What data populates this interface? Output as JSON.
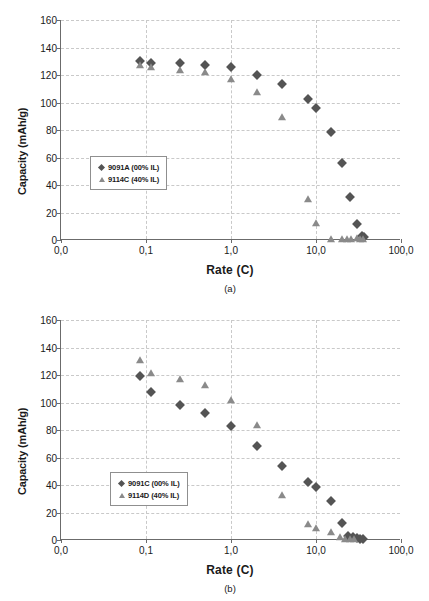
{
  "figure": {
    "panels": [
      {
        "caption": "(a)",
        "legend": [
          {
            "label": "9091A (00% IL)",
            "marker": "diamond-icon"
          },
          {
            "label": "9114C (40% IL)",
            "marker": "triangle-icon"
          }
        ]
      },
      {
        "caption": "(b)",
        "legend": [
          {
            "label": "9091C (00% IL)",
            "marker": "diamond-icon"
          },
          {
            "label": "9114D (40% IL)",
            "marker": "triangle-icon"
          }
        ]
      }
    ],
    "bottom_caption": ""
  },
  "axis": {
    "ylabel": "Capacity (mAh/g)",
    "xlabel": "Rate (C)",
    "yticks": [
      "0",
      "20",
      "40",
      "60",
      "80",
      "100",
      "120",
      "140",
      "160"
    ],
    "ytick_values": [
      0,
      20,
      40,
      60,
      80,
      100,
      120,
      140,
      160
    ],
    "xticks": [
      "0,0",
      "0,1",
      "1,0",
      "10,0",
      "100,0"
    ],
    "xtick_values": [
      0.01,
      0.1,
      1.0,
      10.0,
      100.0
    ]
  },
  "colors": {
    "diamond": "#545454",
    "triangle": "#8a8a8a",
    "axis": "#6b6b6b",
    "grid": "#c9c9c9"
  },
  "chart_data": [
    {
      "type": "scatter",
      "panel": "(a)",
      "title": "",
      "xlabel": "Rate (C)",
      "ylabel": "Capacity (mAh/g)",
      "xscale": "log",
      "xlim": [
        0.01,
        100.0
      ],
      "ylim": [
        0,
        160
      ],
      "grid": true,
      "legend_position": "inside-left",
      "series": [
        {
          "name": "9091A (00% IL)",
          "marker": "diamond",
          "color": "#545454",
          "x": [
            0.085,
            0.115,
            0.25,
            0.5,
            1.0,
            2.0,
            4.0,
            8.0,
            10.0,
            15.0,
            20.0,
            25.0,
            30.0,
            35.0,
            37.0
          ],
          "y": [
            130,
            129,
            128.5,
            127,
            125.5,
            120,
            113.5,
            102.5,
            96,
            78.5,
            56,
            31,
            12,
            3,
            2
          ]
        },
        {
          "name": "9114C (40% IL)",
          "marker": "triangle",
          "color": "#8a8a8a",
          "x": [
            0.085,
            0.115,
            0.25,
            0.5,
            1.0,
            2.0,
            4.0,
            8.0,
            10.0,
            15.0,
            20.0,
            23.0,
            26.0,
            30.0,
            33.0,
            36.0
          ],
          "y": [
            127,
            126,
            123.5,
            122.5,
            117,
            108,
            89.5,
            29.5,
            12.5,
            1,
            0.5,
            0.5,
            0.5,
            1.5,
            1,
            0.5
          ]
        }
      ]
    },
    {
      "type": "scatter",
      "panel": "(b)",
      "title": "",
      "xlabel": "Rate (C)",
      "ylabel": "Capacity (mAh/g)",
      "xscale": "log",
      "xlim": [
        0.01,
        100.0
      ],
      "ylim": [
        0,
        160
      ],
      "grid": true,
      "legend_position": "inside-left",
      "series": [
        {
          "name": "9091C (00% IL)",
          "marker": "diamond",
          "color": "#545454",
          "x": [
            0.085,
            0.115,
            0.25,
            0.5,
            1.0,
            2.0,
            4.0,
            8.0,
            10.0,
            15.0,
            20.0,
            24.0,
            27.0,
            30.0,
            33.0,
            36.0
          ],
          "y": [
            119,
            108,
            98.5,
            92.5,
            83,
            68.5,
            54,
            42,
            38.5,
            28.5,
            12.5,
            3,
            2,
            1.5,
            1,
            0.5
          ]
        },
        {
          "name": "9114D (40% IL)",
          "marker": "triangle",
          "color": "#8a8a8a",
          "x": [
            0.085,
            0.115,
            0.25,
            0.5,
            1.0,
            2.0,
            4.0,
            8.0,
            10.0,
            15.0,
            19.0,
            22.0,
            25.0,
            28.0
          ],
          "y": [
            131,
            121.5,
            117,
            112.5,
            102,
            84,
            32.5,
            11.5,
            9,
            6,
            2.5,
            1,
            0.5,
            0.5
          ]
        }
      ]
    }
  ]
}
